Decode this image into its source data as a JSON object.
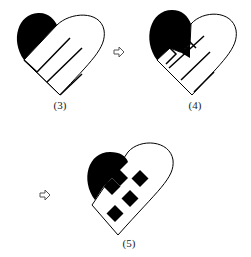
{
  "figures": [
    {
      "label": "(3)"
    },
    {
      "label": "(4)"
    },
    {
      "label": "(5)"
    }
  ],
  "arrows": [
    {
      "icon": "hollow-right-arrow-icon"
    },
    {
      "icon": "hollow-right-arrow-icon"
    }
  ],
  "colors": {
    "ink": "#000000",
    "paper": "#ffffff"
  }
}
